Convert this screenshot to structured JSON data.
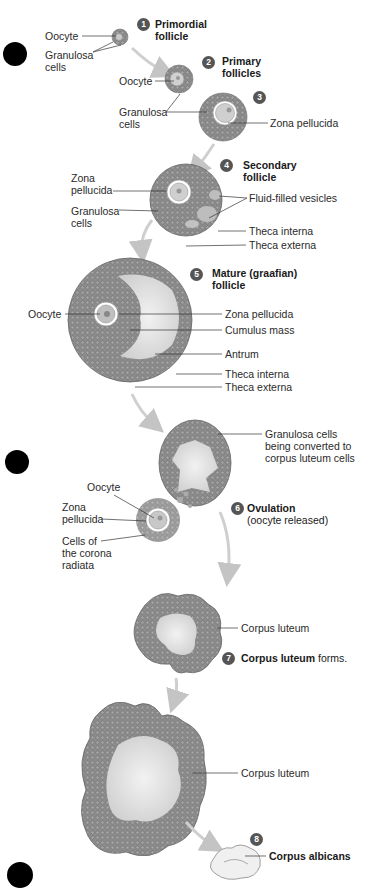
{
  "stages": [
    {
      "number": "1",
      "title": "Primordial follicle",
      "lines": [
        "Primordial",
        "follicle"
      ]
    },
    {
      "number": "2",
      "title": "Primary follicles",
      "lines": [
        "Primary",
        "follicles"
      ]
    },
    {
      "number": "3",
      "title": ""
    },
    {
      "number": "4",
      "title": "Secondary follicle",
      "lines": [
        "Secondary",
        "follicle"
      ]
    },
    {
      "number": "5",
      "title": "Mature (graafian) follicle",
      "lines": [
        "Mature (graafian)",
        "follicle"
      ]
    },
    {
      "number": "6",
      "title": "Ovulation",
      "subtitle": "(oocyte released)"
    },
    {
      "number": "7",
      "title": "Corpus luteum",
      "suffix": " forms."
    },
    {
      "number": "8",
      "title": "Corpus albicans"
    }
  ],
  "labels": {
    "s1_oocyte": "Oocyte",
    "s1_granulosa": [
      "Granulosa",
      "cells"
    ],
    "s2_oocyte": "Oocyte",
    "s2_granulosa": [
      "Granulosa",
      "cells"
    ],
    "s3_zona": "Zona  pellucida",
    "s4_zona": [
      "Zona",
      "pellucida"
    ],
    "s4_granulosa": [
      "Granulosa",
      "cells"
    ],
    "s4_vesicles": "Fluid-filled vesicles",
    "s4_theca_interna": "Theca interna",
    "s4_theca_externa": "Theca externa",
    "s5_oocyte": "Oocyte",
    "s5_zona": "Zona pellucida",
    "s5_cumulus": "Cumulus mass",
    "s5_antrum": "Antrum",
    "s5_theca_interna": "Theca interna",
    "s5_theca_externa": "Theca externa",
    "s6_granulosa": [
      "Granulosa cells",
      "being converted to",
      "corpus luteum cells"
    ],
    "s6_oocyte": "Oocyte",
    "s6_zona": [
      "Zona",
      "pellucida"
    ],
    "s6_corona": [
      "Cells of",
      "the corona",
      "radiata"
    ],
    "s7_corpus_luteum": "Corpus luteum",
    "s7b_corpus_luteum": "Corpus luteum"
  },
  "colors": {
    "tissue": "#8a8a8a",
    "tissue_dark": "#6f6f6f",
    "fluid": "#e4e4e4",
    "arrow": "#c8c8c8",
    "badge": "#555555",
    "leader": "#333333"
  }
}
